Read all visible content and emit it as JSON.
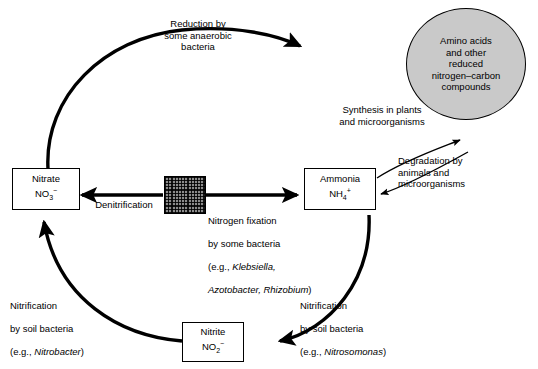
{
  "diagram": {
    "nodes": {
      "nitrate": {
        "line1": "Nitrate",
        "line2_main": "NO",
        "line2_sub": "3",
        "line2_sup": "−"
      },
      "ammonia": {
        "line1": "Ammonia",
        "line2_main": "NH",
        "line2_sub": "4",
        "line2_sup": "+"
      },
      "nitrite": {
        "line1": "Nitrite",
        "line2_main": "NO",
        "line2_sub": "2",
        "line2_sup": "−"
      },
      "amino_acids": {
        "text": "Amino acids\nand other\nreduced\nnitrogen–carbon\ncompounds"
      }
    },
    "labels": {
      "reduction": "Reduction by\nsome anaerobic\nbacteria",
      "synthesis": "Synthesis in plants\nand microorganisms",
      "degradation": "Degradation by\nanimals and\nmicroorganisms",
      "denitrification": "Denitrification",
      "nitrogen_fixation_line1": "Nitrogen fixation",
      "nitrogen_fixation_line2": "by some bacteria",
      "nitrogen_fixation_line3_prefix": "(e.g., ",
      "nitrogen_fixation_line3_italic": "Klebsiella,",
      "nitrogen_fixation_line4_italic": "Azotobacter, Rhizobium",
      "nitrogen_fixation_line4_suffix": ")",
      "nitrification_left_line1": "Nitrification",
      "nitrification_left_line2": "by soil bacteria",
      "nitrification_left_line3_prefix": "(e.g., ",
      "nitrification_left_line3_italic": "Nitrobacter",
      "nitrification_left_line3_suffix": ")",
      "nitrification_right_line1": "Nitrification",
      "nitrification_right_line2": "by soil bacteria",
      "nitrification_right_line3_prefix": "(e.g., ",
      "nitrification_right_line3_italic": "Nitrosomonas",
      "nitrification_right_line3_suffix": ")"
    },
    "colors": {
      "stroke": "#000000",
      "ellipse_fill": "#c9c9c9",
      "background": "#ffffff",
      "hatch_fill": "#8c8c8c"
    }
  }
}
